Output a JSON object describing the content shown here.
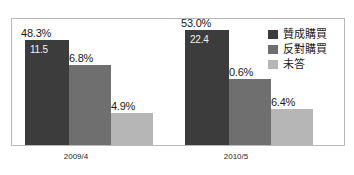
{
  "chart_data": {
    "type": "bar",
    "title": "",
    "subtitle": "",
    "xlabel": "",
    "ylabel": "",
    "categories": [
      "2009/4",
      "2010/5"
    ],
    "series": [
      {
        "name": "贊成購買",
        "color": "#3c3c3c",
        "values": [
          48.3,
          53.0
        ],
        "labels": [
          "48.3%",
          "53.0%"
        ],
        "inner_labels": [
          "11.5",
          "22.4"
        ]
      },
      {
        "name": "反對購買",
        "color": "#6f6f6f",
        "values": [
          36.8,
          30.6
        ],
        "labels": [
          "36.8%",
          "30.6%"
        ],
        "inner_labels": [
          "",
          ""
        ]
      },
      {
        "name": "未答",
        "color": "#b6b6b6",
        "values": [
          14.9,
          16.4
        ],
        "labels": [
          "14.9%",
          "16.4%"
        ],
        "inner_labels": [
          "",
          ""
        ]
      }
    ],
    "ylim": [
      0,
      58
    ],
    "grid": false,
    "legend_position": "top-right",
    "frame_color": "#b9b9b9",
    "background_color": "#ffffff"
  }
}
